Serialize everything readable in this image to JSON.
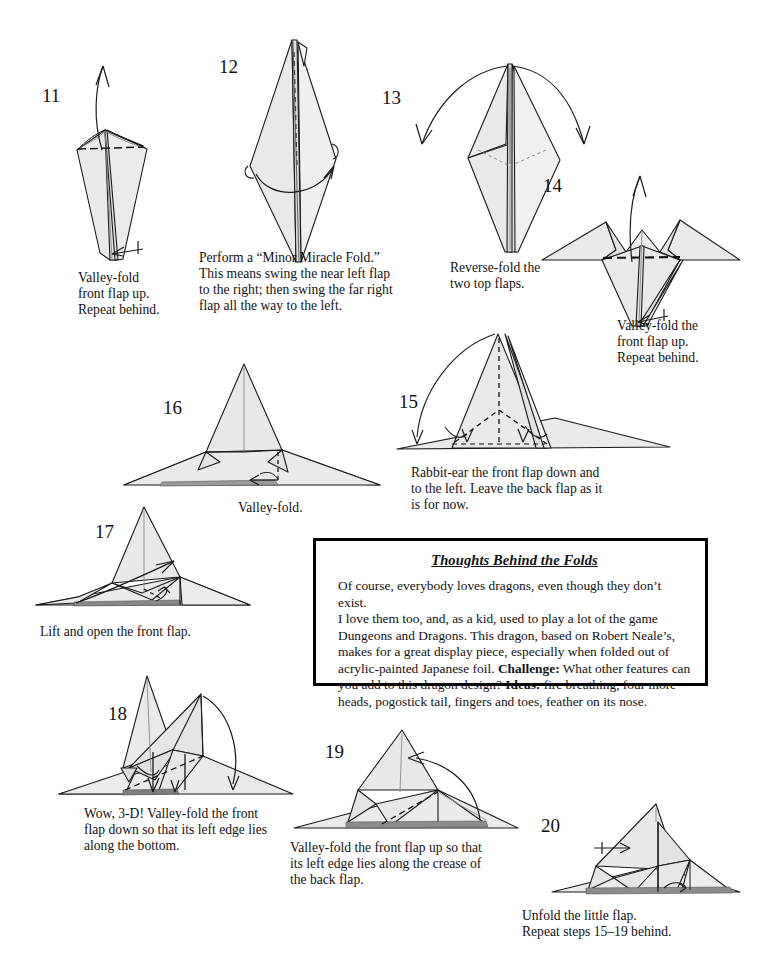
{
  "page": {
    "kind": "origami-instruction-sheet",
    "subject": "dragon",
    "width": 765,
    "height": 979,
    "background_color": "#ffffff",
    "ink_color": "#111111",
    "paper_fill_color": "#e9e9e9",
    "paper_fill_color_dark": "#dcdcdc"
  },
  "steps": [
    {
      "number": "11",
      "caption": "Valley-fold\nfront flap up.\nRepeat behind."
    },
    {
      "number": "12",
      "caption": "Perform a “Minor Miracle Fold.”\nThis means swing the near left flap\nto the right; then swing the far right\nflap all the way to the left."
    },
    {
      "number": "13",
      "caption": "Reverse-fold the\ntwo top flaps."
    },
    {
      "number": "14",
      "caption": "Valley-fold the\nfront flap up.\nRepeat behind."
    },
    {
      "number": "15",
      "caption": "Rabbit-ear the front flap down and\nto the left.  Leave the back flap as it\nis for now."
    },
    {
      "number": "16",
      "caption": "Valley-fold."
    },
    {
      "number": "17",
      "caption": "Lift and open the front flap."
    },
    {
      "number": "18",
      "caption": "Wow, 3-D!  Valley-fold the front\nflap down so that its left edge lies\nalong the bottom."
    },
    {
      "number": "19",
      "caption": "Valley-fold the front flap up so that\nits left edge lies along the crease of\nthe back flap."
    },
    {
      "number": "20",
      "caption": "Unfold the little flap.\nRepeat steps 15–19 behind."
    }
  ],
  "thoughts_box": {
    "title": "Thoughts Behind the Folds",
    "line1": "Of course, everybody loves dragons, even though they don’t exist.",
    "line2": "I love them too, and, as a kid, used to play a lot of the game",
    "line3": "Dungeons and Dragons.  This dragon, based on Robert Neale’s,",
    "line4": "makes for a great display piece, especially when folded out of",
    "line5a": "acrylic-painted Japanese foil.  ",
    "line5b": "Challenge:",
    "line5c": " What other features can",
    "line6a": "you add to this dragon design?  ",
    "line6b": "Ideas:",
    "line6c": " fire breathing, four more",
    "line7": "heads, pogostick tail, fingers and toes, feather on its nose."
  }
}
